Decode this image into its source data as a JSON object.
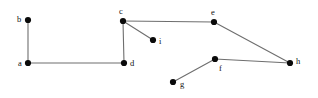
{
  "figure": {
    "background_color": "#ffffff",
    "width": 318,
    "height": 98
  },
  "style": {
    "node_color": "#0a0a0a",
    "node_radius": 3.1,
    "edge_color": "#6e6e6e",
    "edge_width": 1.1,
    "label_color": "#111111",
    "label_font_size": 8.5
  },
  "chart_data": {
    "type": "diagram",
    "graph_type": "undirected-node-link",
    "xlabel": "",
    "ylabel": "",
    "node_count": 9,
    "edge_count": 8,
    "nodes": [
      {
        "id": "a",
        "label": "a",
        "x": 28,
        "y": 63,
        "label_x": 18,
        "label_y": 59
      },
      {
        "id": "b",
        "label": "b",
        "x": 28,
        "y": 20,
        "label_x": 17,
        "label_y": 15
      },
      {
        "id": "c",
        "label": "c",
        "x": 123,
        "y": 21,
        "label_x": 119,
        "label_y": 7
      },
      {
        "id": "d",
        "label": "d",
        "x": 124,
        "y": 63,
        "label_x": 130,
        "label_y": 59
      },
      {
        "id": "e",
        "label": "e",
        "x": 214,
        "y": 22,
        "label_x": 211,
        "label_y": 8
      },
      {
        "id": "f",
        "label": "f",
        "x": 215,
        "y": 59,
        "label_x": 219,
        "label_y": 64
      },
      {
        "id": "g",
        "label": "g",
        "x": 173,
        "y": 82,
        "label_x": 180,
        "label_y": 80
      },
      {
        "id": "h",
        "label": "h",
        "x": 290,
        "y": 63,
        "label_x": 296,
        "label_y": 57
      },
      {
        "id": "i",
        "label": "i",
        "x": 153,
        "y": 40,
        "label_x": 159,
        "label_y": 37
      }
    ],
    "edges": [
      {
        "from": "b",
        "to": "a",
        "label": "b-a"
      },
      {
        "from": "a",
        "to": "d",
        "label": "a-d"
      },
      {
        "from": "d",
        "to": "c",
        "label": "d-c"
      },
      {
        "from": "c",
        "to": "i",
        "label": "c-i"
      },
      {
        "from": "c",
        "to": "e",
        "label": "c-e"
      },
      {
        "from": "e",
        "to": "h",
        "label": "e-h"
      },
      {
        "from": "h",
        "to": "f",
        "label": "h-f"
      },
      {
        "from": "f",
        "to": "g",
        "label": "f-g"
      }
    ]
  }
}
